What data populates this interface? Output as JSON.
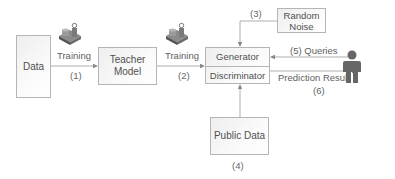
{
  "diagram": {
    "nodes": {
      "data": {
        "label": "Data"
      },
      "teacher": {
        "label_line1": "Teacher",
        "label_line2": "Model"
      },
      "generator": {
        "label": "Generator"
      },
      "discriminator": {
        "label": "Discriminator"
      },
      "noise": {
        "label_line1": "Random",
        "label_line2": "Noise"
      },
      "public": {
        "label": "Public Data"
      }
    },
    "edges": {
      "e1": {
        "label": "Training",
        "step": "(1)"
      },
      "e2": {
        "label": "Training",
        "step": "(2)"
      },
      "e3": {
        "step": "(3)"
      },
      "e4": {
        "step": "(4)"
      },
      "e5": {
        "label": "(5) Queries"
      },
      "e6": {
        "label": "Prediction Result",
        "step": "(6)"
      }
    },
    "icons": {
      "training_icon": "machine-icon",
      "user_icon": "person-icon"
    },
    "colors": {
      "box_border": "#b5b5b5",
      "arrow": "#8a8a8a",
      "person": "#666666"
    }
  }
}
